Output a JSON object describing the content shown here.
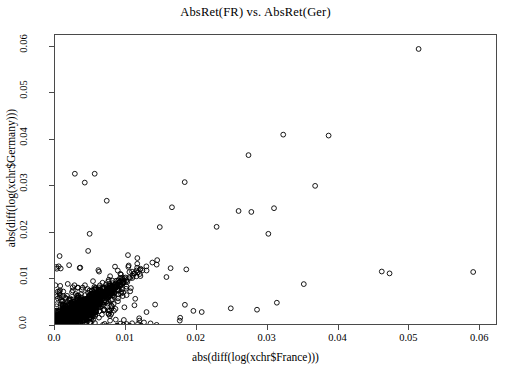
{
  "chart_data": {
    "type": "scatter",
    "title": "AbsRet(FR) vs. AbsRet(Ger)",
    "xlabel": "abs(diff(log(xchr$France)))",
    "ylabel": "abs(diff(log(xchr$Germany)))",
    "xlim": [
      0.0,
      0.0625
    ],
    "ylim": [
      0.0,
      0.0625
    ],
    "xticks": [
      "0.0",
      "0.01",
      "0.02",
      "0.03",
      "0.04",
      "0.05",
      "0.06"
    ],
    "xtick_values": [
      0.0,
      0.01,
      0.02,
      0.03,
      0.04,
      0.05,
      0.06
    ],
    "yticks": [
      "0.0",
      "0.01",
      "0.02",
      "0.03",
      "0.04",
      "0.05",
      "0.06"
    ],
    "ytick_values": [
      0.0,
      0.01,
      0.02,
      0.03,
      0.04,
      0.05,
      0.06
    ],
    "grid": false,
    "legend": null,
    "marker": "open-circle",
    "marker_color": "#000000",
    "marker_radius_px": 2.4,
    "background_color": "#ffffff",
    "frame_color": "#4a4a4a",
    "series": [
      {
        "name": "daily absolute log-returns (FR vs Ger)",
        "description": "Dense positively-correlated cloud concentrated near the origin with a diagonal band along y=x and scattered outliers.",
        "n_points": 1680,
        "notable_points": [
          [
            0.0513,
            0.0595
          ],
          [
            0.0322,
            0.0411
          ],
          [
            0.0386,
            0.0409
          ],
          [
            0.0273,
            0.0367
          ],
          [
            0.0028,
            0.0327
          ],
          [
            0.0056,
            0.0327
          ],
          [
            0.0042,
            0.0308
          ],
          [
            0.0183,
            0.0309
          ],
          [
            0.0367,
            0.0301
          ],
          [
            0.0073,
            0.0269
          ],
          [
            0.0165,
            0.0255
          ],
          [
            0.0309,
            0.0253
          ],
          [
            0.0259,
            0.0247
          ],
          [
            0.0277,
            0.0245
          ],
          [
            0.0228,
            0.0213
          ],
          [
            0.0301,
            0.0198
          ],
          [
            0.059,
            0.0116
          ],
          [
            0.0461,
            0.0117
          ],
          [
            0.0472,
            0.0113
          ],
          [
            0.0351,
            0.009
          ],
          [
            0.0313,
            0.005
          ],
          [
            0.0285,
            0.0035
          ],
          [
            0.0248,
            0.0038
          ],
          [
            0.0207,
            0.003
          ]
        ]
      }
    ]
  }
}
